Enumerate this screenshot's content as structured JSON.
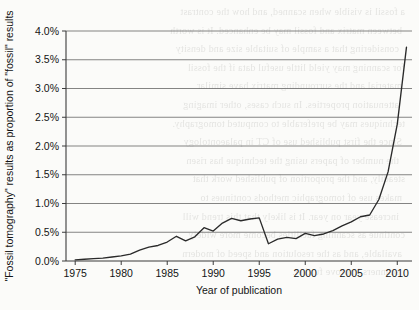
{
  "chart_data": {
    "type": "line",
    "title": "",
    "xlabel": "Year of publication",
    "ylabel": "\"Fossil tomography\" results as proportion of \"fossil\" results",
    "xlim": [
      1974,
      2011.6
    ],
    "ylim": [
      0.0,
      4.0
    ],
    "xtick_labels": [
      "1975",
      "1980",
      "1985",
      "1990",
      "1995",
      "2000",
      "2005",
      "2010"
    ],
    "xticks": [
      1975,
      1980,
      1985,
      1990,
      1995,
      2000,
      2005,
      2010
    ],
    "ytick_labels": [
      "0.0%",
      "0.5%",
      "1.0%",
      "1.5%",
      "2.0%",
      "2.5%",
      "3.0%",
      "3.5%",
      "4.0%"
    ],
    "yticks": [
      0.0,
      0.5,
      1.0,
      1.5,
      2.0,
      2.5,
      3.0,
      3.5,
      4.0
    ],
    "grid": "horizontal",
    "legend": "none",
    "units": "percent",
    "series": [
      {
        "name": "\"Fossil tomography\" results as proportion of \"fossil\" results",
        "color": "#2a2a2a",
        "x": [
          1975,
          1976,
          1977,
          1978,
          1979,
          1980,
          1981,
          1982,
          1983,
          1984,
          1985,
          1986,
          1987,
          1988,
          1989,
          1990,
          1991,
          1992,
          1993,
          1994,
          1995,
          1996,
          1997,
          1998,
          1999,
          2000,
          2001,
          2002,
          2003,
          2004,
          2005,
          2006,
          2007,
          2008,
          2009,
          2010,
          2011
        ],
        "values": [
          0.02,
          0.03,
          0.04,
          0.05,
          0.07,
          0.09,
          0.12,
          0.19,
          0.24,
          0.27,
          0.33,
          0.43,
          0.35,
          0.42,
          0.58,
          0.52,
          0.66,
          0.74,
          0.7,
          0.73,
          0.75,
          0.3,
          0.38,
          0.41,
          0.39,
          0.48,
          0.44,
          0.47,
          0.53,
          0.61,
          0.68,
          0.77,
          0.8,
          1.07,
          1.55,
          2.38,
          3.72
        ]
      }
    ]
  },
  "background_text": {
    "note": "faint reverse-side bleed-through from the scanned page",
    "lines": [
      "a fossil is visible when scanned, and how the contrast",
      "between matrix and fossil may be enhanced. It is worth",
      "considering that a sample of suitable size and density",
      "for scanning may yield little useful data if the fossil",
      "material and the surrounding matrix have similar",
      "attenuation properties. In such cases, other imaging",
      "techniques may be preferable to computed tomography.",
      "Since the first published use of CT in palaeontology",
      "the number of papers using the technique has risen",
      "steadily, and the proportion of published work that",
      "makes use of tomographic methods continues to",
      "increase year on year. It is likely that this trend will",
      "continue as scanning facilities become more widely",
      "available, and as the resolution and speed of modern",
      "scanners improve further."
    ]
  }
}
